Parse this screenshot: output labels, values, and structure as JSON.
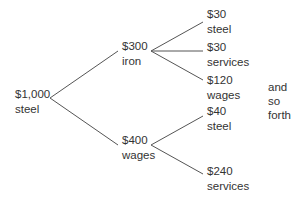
{
  "diagram": {
    "type": "tree",
    "root": {
      "amount": "$1,000",
      "label": "steel"
    },
    "level1": [
      {
        "amount": "$300",
        "label": "iron"
      },
      {
        "amount": "$400",
        "label": "wages"
      }
    ],
    "level2": [
      {
        "parent": 0,
        "amount": "$30",
        "label": "steel"
      },
      {
        "parent": 0,
        "amount": "$30",
        "label": "services"
      },
      {
        "parent": 0,
        "amount": "$120",
        "label": "wages"
      },
      {
        "parent": 1,
        "amount": "$40",
        "label": "steel"
      },
      {
        "parent": 1,
        "amount": "$240",
        "label": "services"
      }
    ],
    "note": [
      "and",
      "so",
      "forth"
    ],
    "line_color": "#555555"
  }
}
